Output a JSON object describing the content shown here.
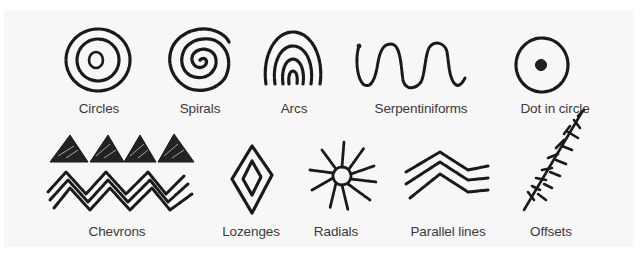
{
  "diagram": {
    "type": "motif-catalog",
    "background_color": "#f7f7f7",
    "ink_color": "#1a1a1a",
    "label_color": "#3a3a3a",
    "rows": [
      {
        "motifs": [
          {
            "id": "circles",
            "label": "Circles",
            "icon": "concentric-circles-icon"
          },
          {
            "id": "spirals",
            "label": "Spirals",
            "icon": "spiral-icon"
          },
          {
            "id": "arcs",
            "label": "Arcs",
            "icon": "nested-arcs-icon"
          },
          {
            "id": "serpentiniforms",
            "label": "Serpentiniforms",
            "icon": "wavy-line-icon"
          },
          {
            "id": "dot-in-circle",
            "label": "Dot in circle",
            "icon": "dot-in-circle-icon"
          }
        ]
      },
      {
        "motifs": [
          {
            "id": "chevrons",
            "label": "Chevrons",
            "icon": "chevrons-icon"
          },
          {
            "id": "lozenges",
            "label": "Lozenges",
            "icon": "lozenge-icon"
          },
          {
            "id": "radials",
            "label": "Radials",
            "icon": "radial-sun-icon"
          },
          {
            "id": "parallel-lines",
            "label": "Parallel lines",
            "icon": "parallel-lines-icon"
          },
          {
            "id": "offsets",
            "label": "Offsets",
            "icon": "offsets-branch-icon"
          }
        ]
      }
    ]
  }
}
